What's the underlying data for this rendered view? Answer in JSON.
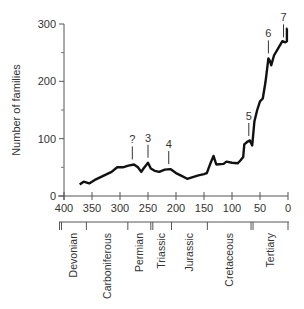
{
  "chart_data": {
    "type": "line",
    "title": "",
    "xlabel": "",
    "ylabel": "Number of families",
    "xlim": [
      400,
      0
    ],
    "ylim": [
      0,
      300
    ],
    "x_ticks": [
      400,
      350,
      300,
      250,
      200,
      150,
      100,
      50,
      0
    ],
    "y_ticks": [
      0,
      100,
      200,
      300
    ],
    "y_minor_ticks": [
      50,
      150,
      250
    ],
    "grid": false,
    "legend": null,
    "series": [
      {
        "name": "Number of families",
        "x": [
          372,
          365,
          355,
          345,
          330,
          315,
          305,
          295,
          285,
          275,
          268,
          262,
          258,
          250,
          245,
          238,
          230,
          220,
          210,
          200,
          190,
          180,
          170,
          160,
          150,
          145,
          138,
          133,
          128,
          115,
          110,
          100,
          90,
          85,
          80,
          78,
          72,
          68,
          64,
          60,
          55,
          50,
          45,
          40,
          35,
          32,
          30,
          25,
          15,
          10,
          5,
          2,
          2,
          1
        ],
        "values": [
          20,
          25,
          22,
          28,
          35,
          42,
          50,
          50,
          53,
          55,
          50,
          42,
          48,
          58,
          48,
          44,
          42,
          46,
          47,
          40,
          35,
          30,
          33,
          36,
          38,
          40,
          58,
          70,
          55,
          56,
          60,
          58,
          57,
          62,
          68,
          90,
          95,
          97,
          88,
          130,
          150,
          165,
          170,
          200,
          240,
          235,
          228,
          245,
          262,
          270,
          268,
          270,
          292,
          292
        ]
      }
    ],
    "annotations": [
      {
        "label": "?",
        "x": 278,
        "y": 55
      },
      {
        "label": "3",
        "x": 250,
        "y": 58
      },
      {
        "label": "4",
        "x": 213,
        "y": 47
      },
      {
        "label": "5",
        "x": 70,
        "y": 96
      },
      {
        "label": "6",
        "x": 35,
        "y": 240
      },
      {
        "label": "7",
        "x": 8,
        "y": 268
      }
    ],
    "periods": [
      {
        "name": "Devonian",
        "start": 408,
        "end": 360
      },
      {
        "name": "Carboniferous",
        "start": 360,
        "end": 286
      },
      {
        "name": "Permian",
        "start": 286,
        "end": 245
      },
      {
        "name": "Triassic",
        "start": 245,
        "end": 208
      },
      {
        "name": "Jurassic",
        "start": 208,
        "end": 144
      },
      {
        "name": "Cretaceous",
        "start": 144,
        "end": 66
      },
      {
        "name": "Tertiary",
        "start": 66,
        "end": 0
      }
    ]
  }
}
